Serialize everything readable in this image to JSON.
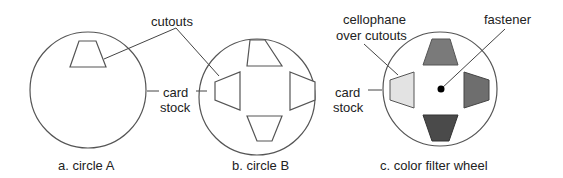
{
  "panels": {
    "a": {
      "caption": "a. circle A"
    },
    "b": {
      "caption": "b. circle B"
    },
    "c": {
      "caption": "c. color filter wheel"
    }
  },
  "labels": {
    "cutouts": "cutouts",
    "card_stock_line1": "card",
    "card_stock_line2": "stock",
    "cellophane_line1": "cellophane",
    "cellophane_line2": "over cutouts",
    "card_stock_c_line1": "card",
    "card_stock_c_line2": "stock",
    "fastener": "fastener"
  },
  "colors": {
    "filter_top": "#7a7a7a",
    "filter_right": "#6e6e6e",
    "filter_bottom": "#4a4a4a",
    "filter_left": "#e3e3e3",
    "fastener": "#000000"
  }
}
